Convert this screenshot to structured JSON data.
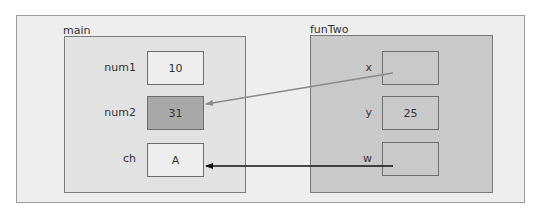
{
  "diagram": {
    "type": "memory-stack-diagram",
    "colors": {
      "outer_background": "#eeeeee",
      "main_frame_fill": "#e2e2e2",
      "funTwo_frame_fill": "#c9c9c9",
      "cell_fill": "#eeeeee",
      "highlighted_cell_fill": "#a8a8a8",
      "reference_arrow_gray": "#8a8a8a",
      "reference_arrow_black": "#111111"
    },
    "frames": [
      {
        "name": "main",
        "variables": [
          {
            "name": "num1",
            "value": "10",
            "highlighted": false
          },
          {
            "name": "num2",
            "value": "31",
            "highlighted": true
          },
          {
            "name": "ch",
            "value": "A",
            "highlighted": false
          }
        ]
      },
      {
        "name": "funTwo",
        "variables": [
          {
            "name": "x",
            "value": "",
            "highlighted": false
          },
          {
            "name": "y",
            "value": "25",
            "highlighted": false
          },
          {
            "name": "w",
            "value": "",
            "highlighted": false
          }
        ]
      }
    ],
    "references": [
      {
        "from": "funTwo.x",
        "to": "main.num2",
        "color": "gray"
      },
      {
        "from": "funTwo.w",
        "to": "main.ch",
        "color": "black"
      }
    ]
  }
}
